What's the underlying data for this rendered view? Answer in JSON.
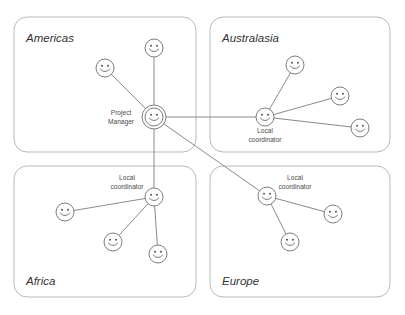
{
  "diagram": {
    "type": "hub-and-spoke network diagram",
    "canvas": {
      "width": 405,
      "height": 315
    },
    "regions": [
      {
        "id": "americas",
        "label": "Americas",
        "label_pos": {
          "x": 26,
          "y": 42
        },
        "box": {
          "x": 14,
          "y": 17,
          "w": 182,
          "h": 135,
          "r": 13
        }
      },
      {
        "id": "australasia",
        "label": "Australasia",
        "label_pos": {
          "x": 222,
          "y": 42
        },
        "box": {
          "x": 210,
          "y": 17,
          "w": 180,
          "h": 135,
          "r": 13
        }
      },
      {
        "id": "africa",
        "label": "Africa",
        "label_pos": {
          "x": 26,
          "y": 285
        },
        "box": {
          "x": 14,
          "y": 166,
          "w": 182,
          "h": 131,
          "r": 13
        }
      },
      {
        "id": "europe",
        "label": "Europe",
        "label_pos": {
          "x": 222,
          "y": 285
        },
        "box": {
          "x": 210,
          "y": 166,
          "w": 180,
          "h": 131,
          "r": 13
        }
      }
    ],
    "nodes": [
      {
        "id": "project-manager",
        "region": "americas",
        "role": "hub",
        "label": "Project\nManager",
        "label_line1": "Project",
        "label_line2": "Manager",
        "x": 154,
        "y": 117,
        "r": 9,
        "ring_r": 12,
        "label_pos": {
          "x": 121,
          "y": 115
        }
      },
      {
        "id": "americas-member-1",
        "region": "americas",
        "role": "member",
        "label": "",
        "x": 105,
        "y": 68,
        "r": 9
      },
      {
        "id": "americas-member-2",
        "region": "americas",
        "role": "member",
        "label": "",
        "x": 154,
        "y": 48,
        "r": 9
      },
      {
        "id": "australasia-coordinator",
        "region": "australasia",
        "role": "coordinator",
        "label": "Local\ncoordinator",
        "label_line1": "Local",
        "label_line2": "coordinator",
        "x": 265,
        "y": 117,
        "r": 9,
        "label_pos": {
          "x": 265,
          "y": 133
        }
      },
      {
        "id": "australasia-member-1",
        "region": "australasia",
        "role": "member",
        "label": "",
        "x": 295,
        "y": 65,
        "r": 9
      },
      {
        "id": "australasia-member-2",
        "region": "australasia",
        "role": "member",
        "label": "",
        "x": 340,
        "y": 96,
        "r": 9
      },
      {
        "id": "australasia-member-3",
        "region": "australasia",
        "role": "member",
        "label": "",
        "x": 360,
        "y": 128,
        "r": 9
      },
      {
        "id": "africa-coordinator",
        "region": "africa",
        "role": "coordinator",
        "label": "Local\ncoordinator",
        "label_line1": "Local",
        "label_line2": "coordinator",
        "x": 154,
        "y": 197,
        "r": 9,
        "label_pos": {
          "x": 127,
          "y": 180
        }
      },
      {
        "id": "africa-member-1",
        "region": "africa",
        "role": "member",
        "label": "",
        "x": 65,
        "y": 212
      },
      {
        "id": "africa-member-2",
        "region": "africa",
        "role": "member",
        "label": "",
        "x": 113,
        "y": 242
      },
      {
        "id": "africa-member-3",
        "region": "africa",
        "role": "member",
        "label": "",
        "x": 158,
        "y": 254
      },
      {
        "id": "europe-coordinator",
        "region": "europe",
        "role": "coordinator",
        "label": "Local\ncoordinator",
        "label_line1": "Local",
        "label_line2": "coordinator",
        "x": 267,
        "y": 196,
        "r": 9,
        "label_pos": {
          "x": 295,
          "y": 180
        }
      },
      {
        "id": "europe-member-1",
        "region": "europe",
        "role": "member",
        "label": "",
        "x": 333,
        "y": 214
      },
      {
        "id": "europe-member-2",
        "region": "europe",
        "role": "member",
        "label": "",
        "x": 290,
        "y": 242
      }
    ],
    "edges": [
      {
        "id": "edge-pm-americas-1",
        "from": "project-manager",
        "to": "americas-member-1"
      },
      {
        "id": "edge-pm-americas-2",
        "from": "project-manager",
        "to": "americas-member-2"
      },
      {
        "id": "edge-pm-australasia",
        "from": "project-manager",
        "to": "australasia-coordinator"
      },
      {
        "id": "edge-pm-africa",
        "from": "project-manager",
        "to": "africa-coordinator"
      },
      {
        "id": "edge-pm-europe",
        "from": "project-manager",
        "to": "europe-coordinator"
      },
      {
        "id": "edge-aus-1",
        "from": "australasia-coordinator",
        "to": "australasia-member-1"
      },
      {
        "id": "edge-aus-2",
        "from": "australasia-coordinator",
        "to": "australasia-member-2"
      },
      {
        "id": "edge-aus-3",
        "from": "australasia-coordinator",
        "to": "australasia-member-3"
      },
      {
        "id": "edge-afr-1",
        "from": "africa-coordinator",
        "to": "africa-member-1"
      },
      {
        "id": "edge-afr-2",
        "from": "africa-coordinator",
        "to": "africa-member-2"
      },
      {
        "id": "edge-afr-3",
        "from": "africa-coordinator",
        "to": "africa-member-3"
      },
      {
        "id": "edge-eur-1",
        "from": "europe-coordinator",
        "to": "europe-member-1"
      },
      {
        "id": "edge-eur-2",
        "from": "europe-coordinator",
        "to": "europe-member-2"
      }
    ],
    "colors": {
      "box_stroke": "#b9b9b9",
      "edge_stroke": "#7d7d7d",
      "node_stroke": "#6e6e6e",
      "face_fill": "#5a5a5a",
      "region_label": "#333333",
      "node_label": "#4a4a4a",
      "background": "#ffffff"
    }
  }
}
